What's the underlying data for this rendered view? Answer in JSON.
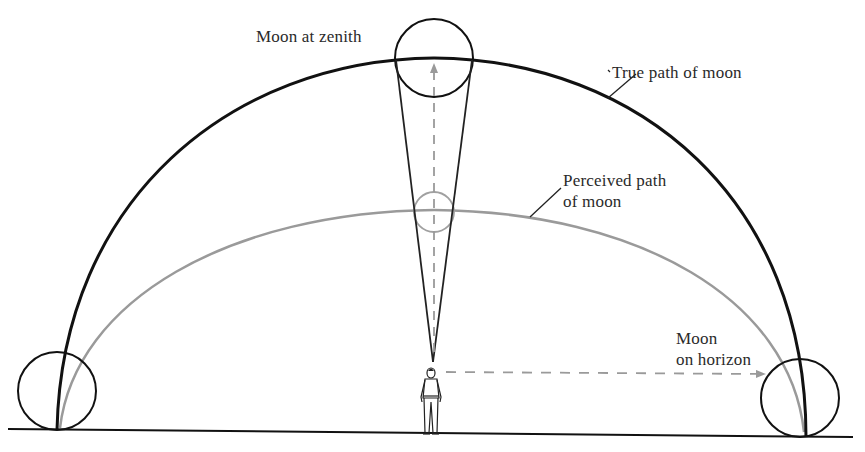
{
  "figure": {
    "labels": {
      "zenith": "Moon at zenith",
      "true_path": "True path of moon",
      "perceived_path_line1": "Perceived path",
      "perceived_path_line2": "of moon",
      "horizon_line1": "Moon",
      "horizon_line2": "on horizon"
    },
    "colors": {
      "background": "#ffffff",
      "true_path": "#111111",
      "perceived_path": "#9a9a9a",
      "moon_outline": "#111111",
      "perceived_moon_outline": "#a0a0a0",
      "sight_lines": "#222222",
      "dashed_arrows": "#9a9a9a",
      "ground": "#111111",
      "text": "#2a2a2a"
    },
    "elements": [
      "ground line",
      "true path of moon (black semicircular arc)",
      "perceived path of moon (gray flattened arc)",
      "moon at zenith (large circle)",
      "perceived moon at zenith (small gray circle)",
      "moon on horizon left (large circle)",
      "moon on horizon right (large circle)",
      "observer figure",
      "visual angle cone lines",
      "dashed arrow up to zenith",
      "dashed arrow to horizon"
    ]
  }
}
